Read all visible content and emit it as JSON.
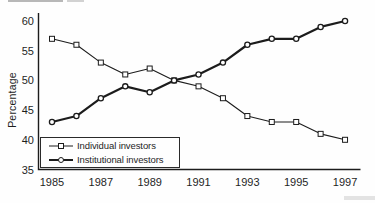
{
  "chart_data": {
    "type": "line",
    "x": [
      1985,
      1986,
      1987,
      1988,
      1989,
      1990,
      1991,
      1992,
      1993,
      1994,
      1995,
      1996,
      1997
    ],
    "series": [
      {
        "name": "Individual investors",
        "marker": "square",
        "line_width": "thin",
        "values": [
          57,
          56,
          53,
          51,
          52,
          50,
          49,
          47,
          44,
          43,
          43,
          41,
          40
        ]
      },
      {
        "name": "Institutional investors",
        "marker": "circle",
        "line_width": "thick",
        "values": [
          43,
          44,
          47,
          49,
          48,
          50,
          51,
          53,
          56,
          57,
          57,
          59,
          60
        ]
      }
    ],
    "title": "",
    "xlabel": "",
    "ylabel": "Percentage",
    "ylim": [
      35,
      60
    ],
    "yticks": [
      35,
      40,
      45,
      50,
      55,
      60
    ],
    "xticks": [
      1985,
      1987,
      1989,
      1991,
      1993,
      1995,
      1997
    ],
    "grid": false,
    "legend_position": "bottom-left",
    "line_color": "#1c1c1c",
    "marker_fill": "#ffffff",
    "background_color": "#fefefe"
  }
}
